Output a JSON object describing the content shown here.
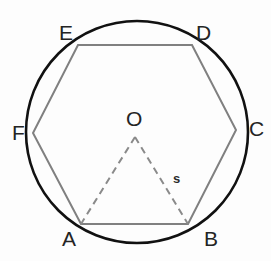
{
  "figure": {
    "background_color": "#fdfdfd",
    "circle_color": "#111111",
    "hexagon_color": "#808080",
    "dashed_color": "#8a8a8a",
    "label_color": "#242424"
  },
  "circle": {
    "name": "circumscribed-circle",
    "cx": 137,
    "cy": 132,
    "r": 111,
    "stroke_width": 2.6
  },
  "hexagon": {
    "name": "inscribed-hexagon",
    "stroke_width": 2.0,
    "vertices": [
      {
        "id": "A",
        "label": "A",
        "x": 81,
        "y": 224,
        "label_x": 62,
        "label_y": 228
      },
      {
        "id": "B",
        "label": "B",
        "x": 188,
        "y": 224,
        "label_x": 204,
        "label_y": 228
      },
      {
        "id": "C",
        "label": "C",
        "x": 236,
        "y": 130,
        "label_x": 249,
        "label_y": 118
      },
      {
        "id": "D",
        "label": "D",
        "x": 192,
        "y": 45,
        "label_x": 196,
        "label_y": 22
      },
      {
        "id": "E",
        "label": "E",
        "x": 78,
        "y": 45,
        "label_x": 59,
        "label_y": 22
      },
      {
        "id": "F",
        "label": "F",
        "x": 33,
        "y": 133,
        "label_x": 12,
        "label_y": 122
      }
    ],
    "edges": [
      {
        "from": "A",
        "to": "B"
      },
      {
        "from": "B",
        "to": "C"
      },
      {
        "from": "C",
        "to": "D"
      },
      {
        "from": "D",
        "to": "E"
      },
      {
        "from": "E",
        "to": "F"
      },
      {
        "from": "F",
        "to": "A"
      }
    ]
  },
  "center": {
    "id": "O",
    "label": "O",
    "x": 135,
    "y": 137,
    "label_x": 126,
    "label_y": 108
  },
  "radii": {
    "name": "central-triangle-radii",
    "stroke_width": 2.0,
    "dash_pattern": "7 5",
    "segments": [
      {
        "from": "O",
        "to": "A",
        "x1": 135,
        "y1": 137,
        "x2": 81,
        "y2": 224
      },
      {
        "from": "O",
        "to": "B",
        "x1": 135,
        "y1": 137,
        "x2": 188,
        "y2": 224
      }
    ]
  },
  "annotations": [
    {
      "id": "s",
      "label": "s",
      "x": 173,
      "y": 172,
      "describes": "length of radius OB"
    }
  ]
}
